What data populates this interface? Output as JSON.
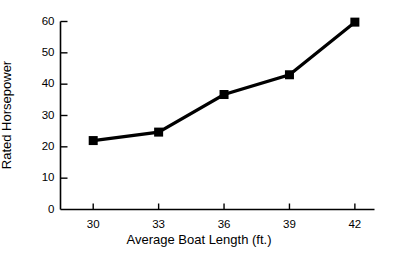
{
  "chart_data": {
    "type": "line",
    "title": "",
    "xlabel": "Average Boat Length (ft.)",
    "ylabel": "Rated Horsepower",
    "x": [
      30,
      33,
      36,
      39,
      42
    ],
    "values": [
      22,
      24.7,
      36.7,
      43,
      59.8
    ],
    "series": [
      {
        "name": "Rated Horsepower",
        "values": [
          22,
          24.7,
          36.7,
          43,
          59.8
        ]
      }
    ],
    "xlim": [
      28.5,
      42.9
    ],
    "ylim": [
      0,
      60
    ],
    "xticks": [
      30,
      33,
      36,
      39,
      42
    ],
    "yticks": [
      0,
      10,
      20,
      30,
      40,
      50,
      60
    ],
    "xtick_labels": [
      "30",
      "33",
      "36",
      "39",
      "42"
    ],
    "ytick_labels": [
      "0",
      "10",
      "20",
      "30",
      "40",
      "50",
      "60"
    ],
    "grid": false,
    "legend": false,
    "legend_position": "none",
    "marker": "square",
    "line_color": "#000000",
    "marker_color": "#000000",
    "background_color": "#ffffff",
    "axis_color": "#000000"
  }
}
